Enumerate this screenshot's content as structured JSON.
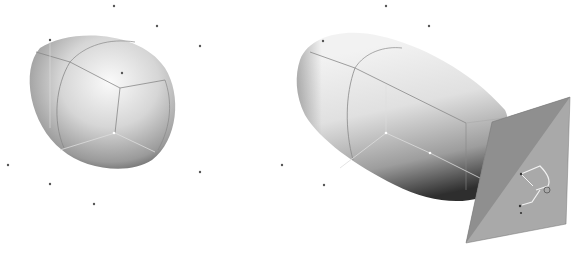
{
  "figure": {
    "left_shape": {
      "label": "rounded-box-shape",
      "points": [
        [
          114,
          6
        ],
        [
          157,
          26
        ],
        [
          200,
          46
        ],
        [
          50,
          40
        ],
        [
          122,
          73
        ],
        [
          8,
          165
        ],
        [
          50,
          184
        ],
        [
          94,
          204
        ],
        [
          200,
          172
        ]
      ]
    },
    "right_shape": {
      "label": "elongated-capsule-shape",
      "points": [
        [
          386,
          6
        ],
        [
          429,
          26
        ],
        [
          323,
          41
        ],
        [
          282,
          165
        ],
        [
          324,
          185
        ]
      ]
    },
    "cutting_plane": {
      "label": "sketch-plane",
      "fill": "#a9a9a9",
      "dark_fill": "#8f8f8f"
    },
    "colors": {
      "background": "#ffffff",
      "surface_light": "#f4f4f4",
      "surface_dark": "#3a3a3a",
      "edge": "#888888"
    }
  }
}
